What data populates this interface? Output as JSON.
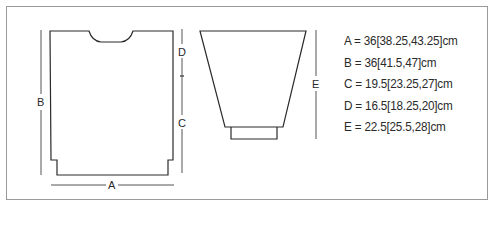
{
  "diagram": {
    "title": "",
    "pieces": [
      {
        "name": "body",
        "description": "Body panel with neckline and hem steps"
      },
      {
        "name": "sleeve",
        "description": "Tapered sleeve with cuff"
      }
    ],
    "dimension_labels": {
      "a": "A",
      "b": "B",
      "c": "C",
      "d": "D",
      "e": "E"
    },
    "legend": [
      {
        "key": "A",
        "text": "A = 36[38.25,43.25]cm"
      },
      {
        "key": "B",
        "text": "B = 36[41.5,47]cm"
      },
      {
        "key": "C",
        "text": "C = 19.5[23.25,27]cm"
      },
      {
        "key": "D",
        "text": "D = 16.5[18.25,20]cm"
      },
      {
        "key": "E",
        "text": "E = 22.5[25.5,28]cm"
      }
    ],
    "colors": {
      "line": "#2a2a2a",
      "dim_line": "#555555",
      "frame": "#9a9a9a",
      "background": "#ffffff"
    }
  }
}
